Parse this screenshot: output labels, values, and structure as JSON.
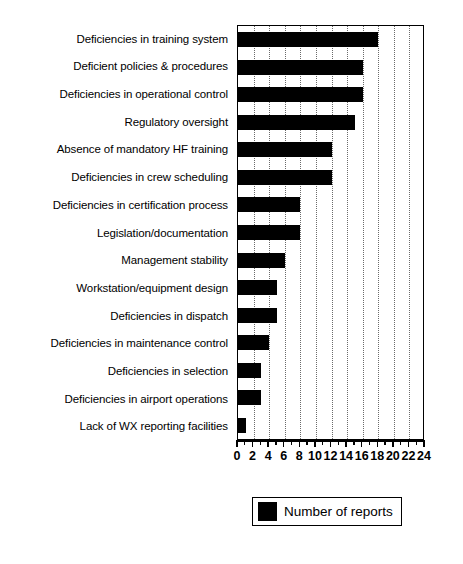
{
  "chart_data": {
    "type": "bar",
    "orientation": "horizontal",
    "title": "",
    "xlabel": "",
    "ylabel": "",
    "xlim": [
      0,
      24
    ],
    "xticks": [
      0,
      2,
      4,
      6,
      8,
      10,
      12,
      14,
      16,
      18,
      20,
      22,
      24
    ],
    "xtick_labels": [
      "0",
      "2",
      "4",
      "6",
      "8",
      "10",
      "12",
      "14",
      "16",
      "18",
      "20",
      "22",
      "24"
    ],
    "minor_tick_step": 1,
    "grid": true,
    "grid_axis": "x",
    "grid_style": "dotted",
    "bar_color": "#000000",
    "categories": [
      "Deficiencies in training system",
      "Deficient policies & procedures",
      "Deficiencies in operational control",
      "Regulatory oversight",
      "Absence of mandatory HF training",
      "Deficiencies in crew scheduling",
      "Deficiencies in certification process",
      "Legislation/documentation",
      "Management stability",
      "Workstation/equipment design",
      "Deficiencies in dispatch",
      "Deficiencies in maintenance control",
      "Deficiencies in selection",
      "Deficiencies in airport operations",
      "Lack of WX reporting facilities"
    ],
    "values": [
      18,
      16,
      16,
      15,
      12,
      12,
      8,
      8,
      6,
      5,
      5,
      4,
      3,
      3,
      1
    ],
    "series": [
      {
        "name": "Number of reports",
        "values": [
          18,
          16,
          16,
          15,
          12,
          12,
          8,
          8,
          6,
          5,
          5,
          4,
          3,
          3,
          1
        ]
      }
    ],
    "legend": {
      "position": "bottom-right",
      "entries": [
        {
          "label": "Number of reports",
          "color": "#000000"
        }
      ]
    }
  }
}
